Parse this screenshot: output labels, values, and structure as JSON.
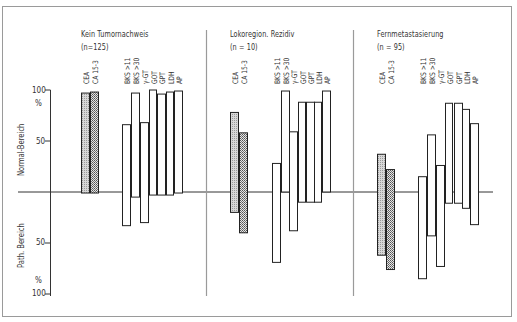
{
  "chart_data": {
    "type": "bar",
    "subtype": "floating-range",
    "title": "",
    "ylabel_upper": "Normal-Bereich",
    "ylabel_lower": "Path. Bereich",
    "unit_upper": "%",
    "unit_lower": "%",
    "ylim": [
      -100,
      100
    ],
    "yticks": [
      {
        "value": 100,
        "label": "100"
      },
      {
        "value": 50,
        "label": "50"
      },
      {
        "value": -50,
        "label": "50"
      },
      {
        "value": -100,
        "label": "100"
      }
    ],
    "categories": [
      "CEA",
      "CA 15-3",
      "BKS >11",
      "BKS >30",
      "γ-GT",
      "GOT",
      "GPT",
      "LDH",
      "AP"
    ],
    "note": "Each bar spans from 'top' (% in normal range, positive) to 'bottom' (% in pathological range, negative). CEA and CA 15-3 bars are hatched.",
    "panels": [
      {
        "title": "Kein Tumornachweis",
        "n_label": "(n=125)",
        "bars": [
          {
            "label": "CEA",
            "top": 97,
            "bottom": -1,
            "pattern": "light-hatch"
          },
          {
            "label": "CA 15-3",
            "top": 98,
            "bottom": -1,
            "pattern": "dense-hatch"
          },
          {
            "label": "BKS >11",
            "top": 66,
            "bottom": -33,
            "pattern": "none"
          },
          {
            "label": "BKS >30",
            "top": 97,
            "bottom": -5,
            "pattern": "none"
          },
          {
            "label": "γ-GT",
            "top": 68,
            "bottom": -30,
            "pattern": "none"
          },
          {
            "label": "GOT",
            "top": 100,
            "bottom": -3,
            "pattern": "none"
          },
          {
            "label": "GPT",
            "top": 96,
            "bottom": -3,
            "pattern": "none"
          },
          {
            "label": "LDH",
            "top": 98,
            "bottom": -3,
            "pattern": "none"
          },
          {
            "label": "AP",
            "top": 99,
            "bottom": -1,
            "pattern": "none"
          }
        ]
      },
      {
        "title": "Lokoregion. Rezidiv",
        "n_label": "(n = 10)",
        "bars": [
          {
            "label": "CEA",
            "top": 78,
            "bottom": -20,
            "pattern": "light-hatch"
          },
          {
            "label": "CA 15-3",
            "top": 58,
            "bottom": -40,
            "pattern": "dense-hatch"
          },
          {
            "label": "BKS >11",
            "top": 28,
            "bottom": -69,
            "pattern": "none"
          },
          {
            "label": "BKS >30",
            "top": 99,
            "bottom": 0,
            "pattern": "none"
          },
          {
            "label": "γ-GT",
            "top": 59,
            "bottom": -38,
            "pattern": "none"
          },
          {
            "label": "GOT",
            "top": 88,
            "bottom": -10,
            "pattern": "none"
          },
          {
            "label": "GPT",
            "top": 88,
            "bottom": -10,
            "pattern": "none"
          },
          {
            "label": "LDH",
            "top": 88,
            "bottom": -10,
            "pattern": "none"
          },
          {
            "label": "AP",
            "top": 99,
            "bottom": 0,
            "pattern": "none"
          }
        ]
      },
      {
        "title": "Fernmetastasierung",
        "n_label": "(n = 95)",
        "bars": [
          {
            "label": "CEA",
            "top": 37,
            "bottom": -62,
            "pattern": "light-hatch"
          },
          {
            "label": "CA 15-3",
            "top": 22,
            "bottom": -76,
            "pattern": "dense-hatch"
          },
          {
            "label": "BKS >11",
            "top": 15,
            "bottom": -85,
            "pattern": "none"
          },
          {
            "label": "BKS >30",
            "top": 56,
            "bottom": -43,
            "pattern": "none"
          },
          {
            "label": "γ-GT",
            "top": 26,
            "bottom": -73,
            "pattern": "none"
          },
          {
            "label": "GOT",
            "top": 87,
            "bottom": -11,
            "pattern": "none"
          },
          {
            "label": "GPT",
            "top": 87,
            "bottom": -11,
            "pattern": "none"
          },
          {
            "label": "LDH",
            "top": 81,
            "bottom": -16,
            "pattern": "none"
          },
          {
            "label": "AP",
            "top": 67,
            "bottom": -32,
            "pattern": "none"
          }
        ]
      }
    ],
    "grid": false,
    "legend": "none"
  },
  "layout": {
    "zero_y": 192,
    "px_per_pct": 1.02,
    "panel_bar_x": [
      [
        81,
        90,
        122,
        131,
        140,
        149,
        157,
        166,
        174
      ],
      [
        230,
        239,
        272,
        281,
        289,
        298,
        306,
        314,
        322
      ],
      [
        377,
        386,
        418,
        427,
        436,
        445,
        454,
        462,
        470
      ]
    ],
    "bar_width": [
      9,
      9,
      9,
      9,
      9,
      8,
      9,
      8,
      9
    ]
  }
}
